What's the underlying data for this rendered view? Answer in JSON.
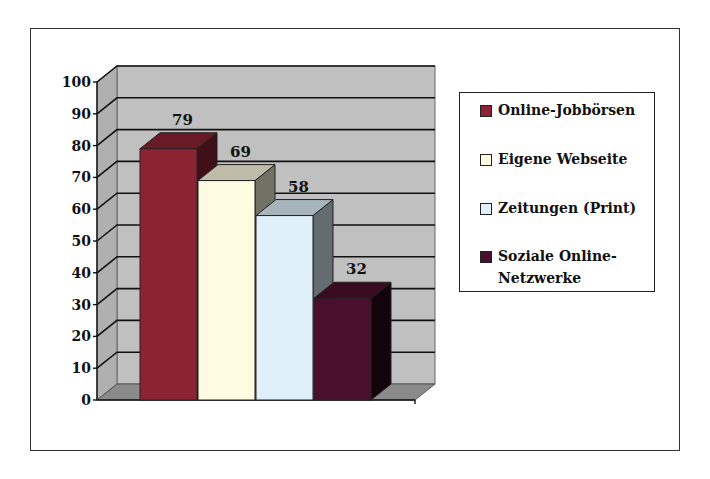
{
  "chart_data": {
    "type": "bar",
    "style": "3d-column",
    "title": "",
    "xlabel": "",
    "ylabel": "",
    "ylim": [
      0,
      100
    ],
    "yticks": [
      0,
      10,
      20,
      30,
      40,
      50,
      60,
      70,
      80,
      90,
      100
    ],
    "grid": true,
    "legend_position": "right",
    "categories": [
      "Online-Jobbörsen",
      "Eigene Webseite",
      "Zeitungen (Print)",
      "Soziale Online-Netzwerke"
    ],
    "values": [
      79,
      69,
      58,
      32
    ],
    "data_labels": [
      "79",
      "69",
      "58",
      "32"
    ],
    "colors": [
      "#8b2332",
      "#fdfbe0",
      "#dff0fb",
      "#4a0f2c"
    ]
  },
  "legend": {
    "items": [
      {
        "label": "Online-Jobbörsen",
        "color": "#8b2332"
      },
      {
        "label": "Eigene Webseite",
        "color": "#fdfbe0"
      },
      {
        "label": "Zeitungen (Print)",
        "color": "#dff0fb"
      },
      {
        "label": "Soziale Online-",
        "label2": "Netzwerke",
        "color": "#4a0f2c"
      }
    ]
  }
}
